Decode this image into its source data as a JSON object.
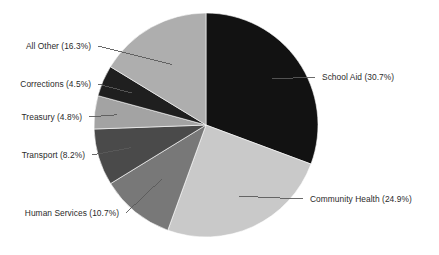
{
  "chart_data": {
    "type": "pie",
    "title": "",
    "subtitle": "",
    "xlabel": "",
    "ylabel": "",
    "legend_position": "none",
    "grid": false,
    "units": "percent",
    "start_angle_deg": 0,
    "direction": "clockwise",
    "total": 100.1,
    "categories": [
      "School Aid",
      "Community Health",
      "Human Services",
      "Transport",
      "Treasury",
      "Corrections",
      "All Other"
    ],
    "values": [
      30.7,
      24.9,
      10.7,
      8.2,
      4.8,
      4.5,
      16.3
    ],
    "colors": [
      "#121212",
      "#c9c9c9",
      "#787878",
      "#4a4a4a",
      "#a3a3a3",
      "#1f1f1f",
      "#aeaeae"
    ],
    "slices": [
      {
        "name": "School Aid",
        "value": 30.7,
        "label": "School Aid (30.7%)",
        "color": "#121212",
        "side": "right"
      },
      {
        "name": "Community Health",
        "value": 24.9,
        "label": "Community Health (24.9%)",
        "color": "#c9c9c9",
        "side": "right"
      },
      {
        "name": "Human Services",
        "value": 10.7,
        "label": "Human Services (10.7%)",
        "color": "#787878",
        "side": "left"
      },
      {
        "name": "Transport",
        "value": 8.2,
        "label": "Transport (8.2%)",
        "color": "#4a4a4a",
        "side": "left"
      },
      {
        "name": "Treasury",
        "value": 4.8,
        "label": "Treasury (4.8%)",
        "color": "#a3a3a3",
        "side": "left"
      },
      {
        "name": "Corrections",
        "value": 4.5,
        "label": "Corrections (4.5%)",
        "color": "#1f1f1f",
        "side": "left"
      },
      {
        "name": "All Other",
        "value": 16.3,
        "label": "All Other (16.3%)",
        "color": "#aeaeae",
        "side": "left"
      }
    ],
    "labels": {
      "school_aid": "School Aid (30.7%)",
      "community_health": "Community Health (24.9%)",
      "human_services": "Human Services (10.7%)",
      "transport": "Transport (8.2%)",
      "treasury": "Treasury (4.8%)",
      "corrections": "Corrections (4.5%)",
      "all_other": "All Other (16.3%)"
    }
  },
  "geometry": {
    "center_x": 206,
    "center_y": 125,
    "radius": 112
  },
  "style": {
    "background": "#ffffff",
    "leader_line_color": "#5a5a5a",
    "label_text_color": "#2b2b2b"
  }
}
